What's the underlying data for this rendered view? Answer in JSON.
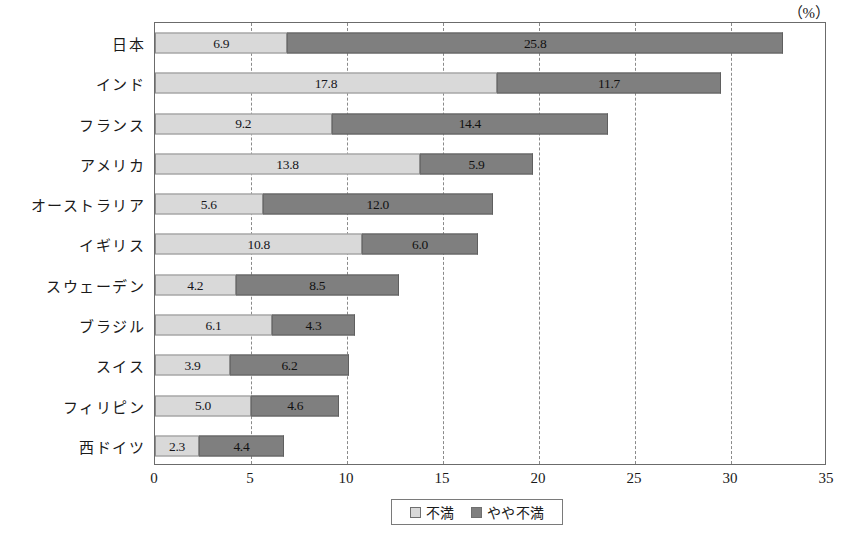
{
  "unit_label": "（%）",
  "legend": {
    "items": [
      {
        "name": "series-dissatisfied",
        "label": "不満",
        "color": "#d9d9d9"
      },
      {
        "name": "series-somewhat-dissatisfied",
        "label": "やや不満",
        "color": "#7f7f7f"
      }
    ]
  },
  "chart_data": {
    "type": "bar",
    "orientation": "horizontal",
    "stacked": true,
    "title": "",
    "xlabel": "",
    "ylabel": "",
    "unit": "（%）",
    "xlim": [
      0,
      35
    ],
    "xticks": [
      0,
      5,
      10,
      15,
      20,
      25,
      30,
      35
    ],
    "xtick_labels": [
      "0",
      "5",
      "10",
      "15",
      "20",
      "25",
      "30",
      "35"
    ],
    "grid": "vertical-dashed",
    "legend_position": "bottom-center",
    "categories": [
      "日本",
      "インド",
      "フランス",
      "アメリカ",
      "オーストラリア",
      "イギリス",
      "スウェーデン",
      "ブラジル",
      "スイス",
      "フィリピン",
      "西ドイツ"
    ],
    "series": [
      {
        "name": "不満",
        "color": "#d9d9d9",
        "values": [
          6.9,
          17.8,
          9.2,
          13.8,
          5.6,
          10.8,
          4.2,
          6.1,
          3.9,
          5.0,
          2.3
        ],
        "labels": [
          "6.9",
          "17.8",
          "9.2",
          "13.8",
          "5.6",
          "10.8",
          "4.2",
          "6.1",
          "3.9",
          "5.0",
          "2.3"
        ]
      },
      {
        "name": "やや不満",
        "color": "#7f7f7f",
        "values": [
          25.8,
          11.7,
          14.4,
          5.9,
          12.0,
          6.0,
          8.5,
          4.3,
          6.2,
          4.6,
          4.4
        ],
        "labels": [
          "25.8",
          "11.7",
          "14.4",
          "5.9",
          "12.0",
          "6.0",
          "8.5",
          "4.3",
          "6.2",
          "4.6",
          "4.4"
        ]
      }
    ],
    "totals": [
      32.7,
      29.5,
      23.6,
      19.7,
      17.6,
      16.8,
      12.7,
      10.4,
      10.1,
      9.6,
      6.7
    ]
  }
}
